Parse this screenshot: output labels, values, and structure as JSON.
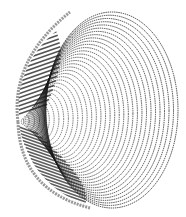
{
  "image": {
    "description": "Monochrome line-art rendering of a cone / paraboloid shape drawn with concentric arcs",
    "width": 186,
    "height": 217,
    "background": "#ffffff",
    "ink_color": "#1a1a1a",
    "apex": {
      "x": 18,
      "y": 122
    },
    "rim": {
      "cx": 112,
      "cy": 110,
      "rx": 66,
      "ry": 98
    },
    "arc_count": 34
  }
}
